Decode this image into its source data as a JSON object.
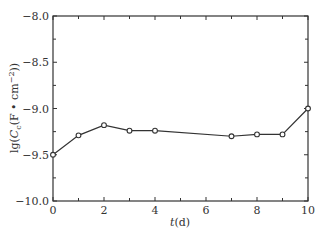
{
  "chart_data": {
    "type": "line",
    "title": "",
    "xlabel": "t (d)",
    "xlabel_var": "t",
    "xlabel_unit": "(d)",
    "ylabel": "lg(Cc (F • cm⁻²))",
    "ylabel_parts": {
      "prefix": "lg(",
      "var": "C",
      "sub": "c",
      "unit": "(F • cm",
      "sup": "−2",
      "suffix": "))"
    },
    "xlim": [
      0,
      10
    ],
    "ylim": [
      -10.0,
      -8.0
    ],
    "xticks": [
      0,
      2,
      4,
      6,
      8,
      10
    ],
    "xtick_labels": [
      "0",
      "2",
      "4",
      "6",
      "8",
      "10"
    ],
    "xminor_ticks": [
      1,
      3,
      5,
      7,
      9
    ],
    "yticks": [
      -10.0,
      -9.5,
      -9.0,
      -8.5,
      -8.0
    ],
    "ytick_labels": [
      "−10.0",
      "−9.5",
      "−9.0",
      "−8.5",
      "−8.0"
    ],
    "yminor_ticks": [
      -9.75,
      -9.25,
      -8.75,
      -8.25
    ],
    "grid": false,
    "legend": null,
    "series": [
      {
        "name": "lg Cc",
        "marker": "open-circle",
        "color": "#333333",
        "x": [
          0,
          1,
          2,
          3,
          4,
          7,
          8,
          9,
          10
        ],
        "values": [
          -9.5,
          -9.29,
          -9.18,
          -9.24,
          -9.24,
          -9.3,
          -9.28,
          -9.28,
          -9.0
        ]
      }
    ]
  }
}
